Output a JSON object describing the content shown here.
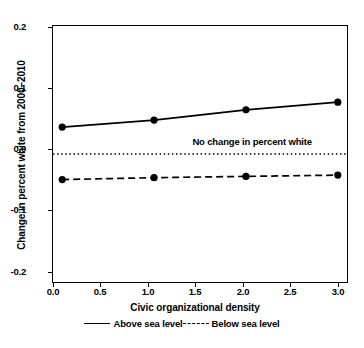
{
  "chart_data": {
    "type": "line",
    "title": "",
    "xlabel": "Civic organizational density",
    "ylabel": "Change in percent white from 2000–2010",
    "x": [
      0.0,
      1.0,
      2.0,
      3.0
    ],
    "xlim": [
      -0.1,
      3.1
    ],
    "ylim": [
      -0.2,
      0.2
    ],
    "xticks": [
      "0.0",
      "0.5",
      "1.0",
      "1.5",
      "2.0",
      "2.5",
      "3.0"
    ],
    "xtick_values": [
      0.0,
      0.5,
      1.0,
      1.5,
      2.0,
      2.5,
      3.0
    ],
    "yticks": [
      "0.2",
      "0.1",
      "0.0",
      "-0.1",
      "-0.2"
    ],
    "ytick_values": [
      0.2,
      0.1,
      0.0,
      -0.1,
      -0.2
    ],
    "grid": false,
    "legend_position": "below",
    "series": [
      {
        "name": "Above sea level",
        "style": "solid",
        "marker": "filled-circle",
        "color": "#000000",
        "values": [
          0.042,
          0.053,
          0.069,
          0.081
        ]
      },
      {
        "name": "Below sea level",
        "style": "dashed",
        "marker": "filled-circle",
        "color": "#000000",
        "values": [
          -0.04,
          -0.037,
          -0.035,
          -0.033
        ]
      }
    ],
    "reference_lines": [
      {
        "name": "zero-line",
        "y": 0.0,
        "style": "dotted",
        "label": "No change in percent white"
      }
    ]
  },
  "legend": {
    "items": [
      {
        "label": "Above sea level",
        "style": "solid"
      },
      {
        "label": "Below sea level",
        "style": "dashed"
      }
    ]
  }
}
